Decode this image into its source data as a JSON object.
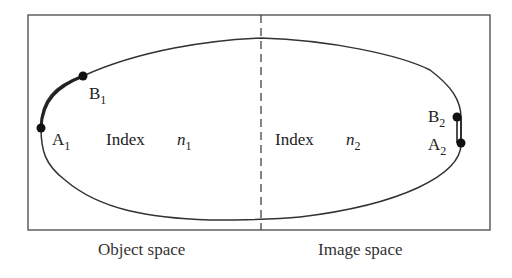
{
  "diagram": {
    "type": "optical-path-schematic",
    "colors": {
      "line": "#333333",
      "frame": "#555555",
      "point": "#111111",
      "background": "#ffffff"
    },
    "regions": [
      {
        "id": "object",
        "caption": "Object space",
        "index_label": "Index",
        "index_symbol": "n",
        "index_sub": "1"
      },
      {
        "id": "image",
        "caption": "Image space",
        "index_label": "Index",
        "index_symbol": "n",
        "index_sub": "2"
      }
    ],
    "points": [
      {
        "name": "A",
        "sub": "1",
        "x": 41,
        "y": 128
      },
      {
        "name": "B",
        "sub": "1",
        "x": 83,
        "y": 76
      },
      {
        "name": "B",
        "sub": "2",
        "x": 457,
        "y": 117
      },
      {
        "name": "A",
        "sub": "2",
        "x": 461,
        "y": 143
      }
    ],
    "divider": {
      "style": "dashed",
      "x": 261
    }
  }
}
